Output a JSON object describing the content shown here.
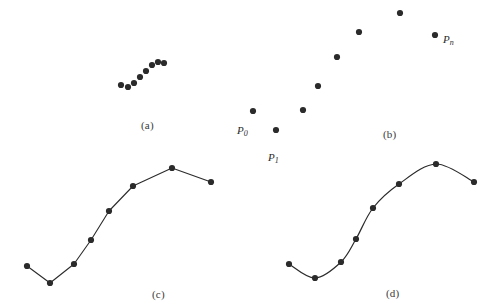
{
  "figure": {
    "width": 492,
    "height": 307,
    "background": "#ffffff",
    "ink_color": "#2b2b2b",
    "dot_radius": 3.1
  },
  "panels": [
    {
      "id": "a",
      "caption": "(a)",
      "caption_pos": {
        "x": 141,
        "y": 119
      },
      "description": "scattered data points only",
      "render": "dots",
      "points": [
        {
          "x": 121,
          "y": 85
        },
        {
          "x": 128,
          "y": 87
        },
        {
          "x": 134,
          "y": 83
        },
        {
          "x": 140,
          "y": 77
        },
        {
          "x": 146,
          "y": 71
        },
        {
          "x": 152,
          "y": 65
        },
        {
          "x": 158,
          "y": 62
        },
        {
          "x": 164,
          "y": 63
        }
      ]
    },
    {
      "id": "b",
      "caption": "(b)",
      "caption_pos": {
        "x": 383,
        "y": 128
      },
      "description": "labeled data points P0 through Pn",
      "render": "dots",
      "points": [
        {
          "x": 253,
          "y": 111,
          "label": "P",
          "sub": "0",
          "label_dx": -16,
          "label_dy": 13
        },
        {
          "x": 276,
          "y": 130,
          "label": "P",
          "sub": "1",
          "label_dx": -8,
          "label_dy": 21
        },
        {
          "x": 303,
          "y": 110
        },
        {
          "x": 318,
          "y": 86
        },
        {
          "x": 337,
          "y": 57
        },
        {
          "x": 359,
          "y": 32
        },
        {
          "x": 400,
          "y": 13
        },
        {
          "x": 435,
          "y": 35,
          "label": "P",
          "sub": "n",
          "label_dx": 8,
          "label_dy": -2
        }
      ]
    },
    {
      "id": "c",
      "caption": "(c)",
      "caption_pos": {
        "x": 152,
        "y": 288
      },
      "description": "piecewise linear polyline through the points",
      "render": "polyline",
      "points": [
        {
          "x": 27,
          "y": 266
        },
        {
          "x": 50,
          "y": 283
        },
        {
          "x": 74,
          "y": 264
        },
        {
          "x": 91,
          "y": 240
        },
        {
          "x": 109,
          "y": 211
        },
        {
          "x": 133,
          "y": 186
        },
        {
          "x": 172,
          "y": 168
        },
        {
          "x": 211,
          "y": 182
        }
      ]
    },
    {
      "id": "d",
      "caption": "(d)",
      "caption_pos": {
        "x": 386,
        "y": 287
      },
      "description": "smooth spline curve through the points",
      "render": "spline",
      "points": [
        {
          "x": 289,
          "y": 264
        },
        {
          "x": 315,
          "y": 278
        },
        {
          "x": 341,
          "y": 262
        },
        {
          "x": 356,
          "y": 239
        },
        {
          "x": 373,
          "y": 208
        },
        {
          "x": 399,
          "y": 184
        },
        {
          "x": 436,
          "y": 164
        },
        {
          "x": 474,
          "y": 182
        }
      ]
    }
  ]
}
